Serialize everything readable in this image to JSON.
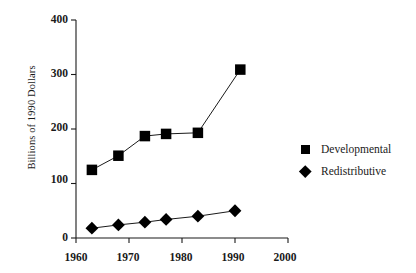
{
  "chart_data": {
    "type": "line",
    "title": "",
    "subtitle": "",
    "xlabel": "",
    "ylabel": "Billions of 1990 Dollars",
    "xlim": [
      1960,
      2000
    ],
    "ylim": [
      0,
      400
    ],
    "grid": false,
    "legend_position": "right",
    "xticks": [
      "1960",
      "1970",
      "1980",
      "1990",
      "2000"
    ],
    "xtick_values": [
      1960,
      1970,
      1980,
      1990,
      2000
    ],
    "yticks": [
      "0",
      "100",
      "200",
      "300",
      "400"
    ],
    "ytick_values": [
      0,
      100,
      200,
      300,
      400
    ],
    "series": [
      {
        "name": "Developmental",
        "marker": "square",
        "color": "#000000",
        "x": [
          1963,
          1968,
          1973,
          1977,
          1983,
          1991
        ],
        "values": [
          125,
          151,
          187,
          191,
          193,
          309
        ]
      },
      {
        "name": "Redistributive",
        "marker": "diamond",
        "color": "#000000",
        "x": [
          1963,
          1968,
          1973,
          1977,
          1983,
          1990
        ],
        "values": [
          18,
          24,
          29,
          34,
          40,
          50
        ]
      }
    ]
  },
  "legend": {
    "items": [
      {
        "label": "Developmental",
        "marker": "square"
      },
      {
        "label": "Redistributive",
        "marker": "diamond"
      }
    ]
  },
  "axes": {
    "y_title": "Billions of 1990 Dollars",
    "y_labels": [
      "400",
      "300",
      "200",
      "100",
      "0"
    ],
    "x_labels": [
      "1960",
      "1970",
      "1980",
      "1990",
      "2000"
    ]
  }
}
